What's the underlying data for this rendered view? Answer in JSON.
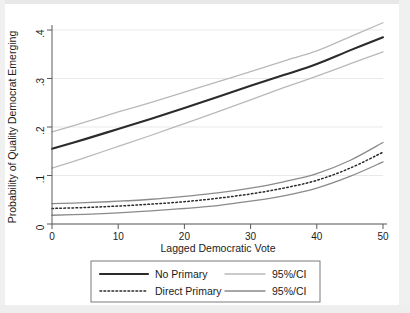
{
  "chart_data": {
    "type": "line",
    "title": "",
    "xlabel": "Lagged Democratic Vote",
    "ylabel": "Probability of Quality Democrat Emerging",
    "xlim": [
      0,
      50
    ],
    "ylim": [
      0,
      0.4
    ],
    "xticks": [
      0,
      10,
      20,
      30,
      40,
      50
    ],
    "xticklabels": [
      "0",
      "10",
      "20",
      "30",
      "40",
      "50"
    ],
    "yticks": [
      0,
      0.1,
      0.2,
      0.3,
      0.4
    ],
    "yticklabels": [
      "0",
      ".1",
      ".2",
      ".3",
      ".4"
    ],
    "grid": true,
    "legend_position": "below-axes",
    "x": [
      0,
      5,
      10,
      15,
      20,
      25,
      30,
      35,
      40,
      45,
      50
    ],
    "series": [
      {
        "name": "No Primary",
        "style": "solid",
        "color": "#2b2b2b",
        "width": 2.1,
        "values": [
          0.155,
          0.175,
          0.196,
          0.217,
          0.239,
          0.262,
          0.285,
          0.307,
          0.33,
          0.358,
          0.385
        ]
      },
      {
        "name": "95%/CI",
        "group": "No Primary upper",
        "style": "solid",
        "color": "#b9b9b9",
        "width": 1.3,
        "values": [
          0.19,
          0.21,
          0.231,
          0.251,
          0.272,
          0.293,
          0.314,
          0.336,
          0.357,
          0.386,
          0.415
        ]
      },
      {
        "name": "95%/CI",
        "group": "No Primary lower",
        "style": "solid",
        "color": "#b9b9b9",
        "width": 1.3,
        "values": [
          0.115,
          0.137,
          0.16,
          0.183,
          0.207,
          0.231,
          0.256,
          0.281,
          0.305,
          0.33,
          0.355
        ]
      },
      {
        "name": "Direct Primary",
        "style": "dotted",
        "color": "#2b2b2b",
        "width": 1.5,
        "values": [
          0.032,
          0.034,
          0.037,
          0.041,
          0.046,
          0.053,
          0.062,
          0.074,
          0.09,
          0.115,
          0.148
        ]
      },
      {
        "name": "95%/CI",
        "group": "Direct Primary upper",
        "style": "solid",
        "color": "#8a8a8a",
        "width": 1.3,
        "values": [
          0.042,
          0.044,
          0.047,
          0.051,
          0.057,
          0.064,
          0.074,
          0.087,
          0.104,
          0.131,
          0.168
        ]
      },
      {
        "name": "95%/CI",
        "group": "Direct Primary lower",
        "style": "solid",
        "color": "#8a8a8a",
        "width": 1.3,
        "values": [
          0.018,
          0.02,
          0.023,
          0.027,
          0.032,
          0.038,
          0.047,
          0.058,
          0.074,
          0.098,
          0.128
        ]
      }
    ],
    "legend": [
      {
        "label": "No Primary",
        "style": "solid",
        "color": "#2b2b2b"
      },
      {
        "label": "95%/CI",
        "style": "solid",
        "color": "#b9b9b9"
      },
      {
        "label": "Direct Primary",
        "style": "dotted",
        "color": "#2b2b2b"
      },
      {
        "label": "95%/CI",
        "style": "solid",
        "color": "#8a8a8a"
      }
    ]
  }
}
